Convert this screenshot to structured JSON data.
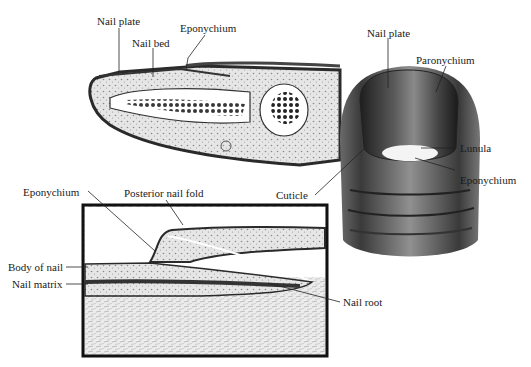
{
  "diagram": {
    "panels": [
      {
        "id": "cross-section",
        "labels": [
          "Nail plate",
          "Nail bed",
          "Eponychium"
        ]
      },
      {
        "id": "inset-detail",
        "labels": [
          "Eponychium",
          "Posterior nail fold",
          "Body of nail",
          "Nail matrix",
          "Nail root"
        ]
      },
      {
        "id": "fingertip-exterior",
        "labels": [
          "Nail plate",
          "Paronychium",
          "Lunula",
          "Eponychium",
          "Cuticle"
        ]
      }
    ]
  },
  "labels": {
    "top_nail_plate": "Nail plate",
    "top_nail_bed": "Nail bed",
    "top_eponychium": "Eponychium",
    "inset_eponychium": "Eponychium",
    "inset_posterior_nail_fold": "Posterior nail fold",
    "inset_body_of_nail": "Body of nail",
    "inset_nail_matrix": "Nail matrix",
    "inset_nail_root": "Nail root",
    "finger_nail_plate": "Nail plate",
    "finger_paronychium": "Paronychium",
    "finger_lunula": "Lunula",
    "finger_eponychium": "Eponychium",
    "finger_cuticle": "Cuticle"
  },
  "colors": {
    "ink": "#1a1a1a",
    "tissue": "#d8d8d8",
    "bone": "#ffffff",
    "skin_dark": "#3a3a3a"
  }
}
